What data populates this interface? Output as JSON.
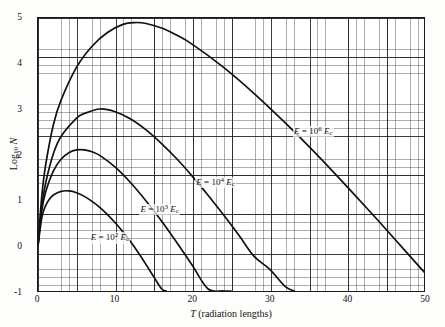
{
  "chart_data": {
    "type": "line",
    "title": "",
    "subtitle": "",
    "xlabel": "T (radiation lengths)",
    "ylabel": "Log10 N",
    "xlim": [
      0,
      50
    ],
    "ylim": [
      -1,
      5
    ],
    "xticks": [
      0,
      10,
      20,
      30,
      40,
      50
    ],
    "yticks": [
      -1,
      0,
      1,
      2,
      3,
      4,
      5
    ],
    "xtick_labels": [
      "0",
      "10",
      "20",
      "30",
      "40",
      "50"
    ],
    "ytick_labels": [
      "-1",
      "0",
      "1",
      "2",
      "3",
      "4",
      "5"
    ],
    "grid": "graph-paper: fine minor grid with heavy major lines every 5 minor cells",
    "legend_position": "inline annotations on curves",
    "series": [
      {
        "name": "E = 10^2 Ec",
        "annotation": "E = 10² Eᴄ",
        "peak_x": 4.0,
        "peak_y": 1.2,
        "x": [
          0,
          0.5,
          1,
          1.5,
          2,
          3,
          4,
          5,
          6,
          7,
          8,
          9,
          10,
          11,
          12,
          13,
          14,
          15,
          16,
          16.6
        ],
        "y": [
          0,
          0.62,
          0.88,
          1.02,
          1.11,
          1.19,
          1.2,
          1.16,
          1.08,
          0.97,
          0.84,
          0.68,
          0.5,
          0.3,
          0.08,
          -0.16,
          -0.42,
          -0.69,
          -0.95,
          -1.0
        ]
      },
      {
        "name": "E = 10^3 Ec",
        "annotation": "E = 10³ Eᴄ",
        "peak_x": 6.0,
        "peak_y": 2.1,
        "x": [
          0,
          0.5,
          1,
          2,
          3,
          4,
          5,
          6,
          7,
          8,
          10,
          12,
          14,
          16,
          18,
          20,
          22,
          24,
          25
        ],
        "y": [
          0,
          0.78,
          1.18,
          1.64,
          1.9,
          2.04,
          2.1,
          2.1,
          2.06,
          1.98,
          1.72,
          1.38,
          0.98,
          0.54,
          0.06,
          -0.44,
          -0.95,
          -1.0,
          -1.0
        ]
      },
      {
        "name": "E = 10^4 Ec",
        "annotation": "E = 10⁴ Eᴄ",
        "peak_x": 8.0,
        "peak_y": 3.0,
        "x": [
          0,
          0.5,
          1,
          2,
          3,
          5,
          6,
          8,
          10,
          12,
          14,
          16,
          18,
          20,
          22,
          24,
          26,
          28,
          30,
          32,
          33.2
        ],
        "y": [
          0,
          0.88,
          1.38,
          2.02,
          2.4,
          2.8,
          2.9,
          3.0,
          2.94,
          2.78,
          2.54,
          2.24,
          1.9,
          1.52,
          1.11,
          0.68,
          0.23,
          -0.24,
          -0.52,
          -0.9,
          -1.0
        ]
      },
      {
        "name": "E = 10^6 Ec",
        "annotation": "E = 10⁶ Eᴄ",
        "peak_x": 12.5,
        "peak_y": 4.9,
        "x": [
          0,
          0.5,
          1,
          2,
          3,
          5,
          7,
          9,
          11,
          12.5,
          14,
          16,
          18,
          20,
          24,
          28,
          32,
          36,
          40,
          44,
          48,
          50
        ],
        "y": [
          0,
          1.1,
          1.78,
          2.66,
          3.2,
          3.92,
          4.38,
          4.68,
          4.86,
          4.9,
          4.88,
          4.78,
          4.62,
          4.42,
          3.92,
          3.34,
          2.7,
          2.02,
          1.3,
          0.56,
          -0.2,
          -0.58
        ]
      }
    ]
  },
  "axis": {
    "x_label_italic": "T",
    "x_label_rest": "(radiation  lengths)",
    "y_label_main": "Log",
    "y_label_sub": "10",
    "y_label_var": "N"
  },
  "annotations": [
    {
      "eq": "E",
      "equals": "=",
      "base": "10",
      "exp": "2",
      "ec_e": "E",
      "ec_c": "c"
    },
    {
      "eq": "E",
      "equals": "=",
      "base": "10",
      "exp": "3",
      "ec_e": "E",
      "ec_c": "c"
    },
    {
      "eq": "E",
      "equals": "=",
      "base": "10",
      "exp": "4",
      "ec_e": "E",
      "ec_c": "c"
    },
    {
      "eq": "E",
      "equals": "=",
      "base": "10",
      "exp": "6",
      "ec_e": "E",
      "ec_c": "c"
    }
  ]
}
